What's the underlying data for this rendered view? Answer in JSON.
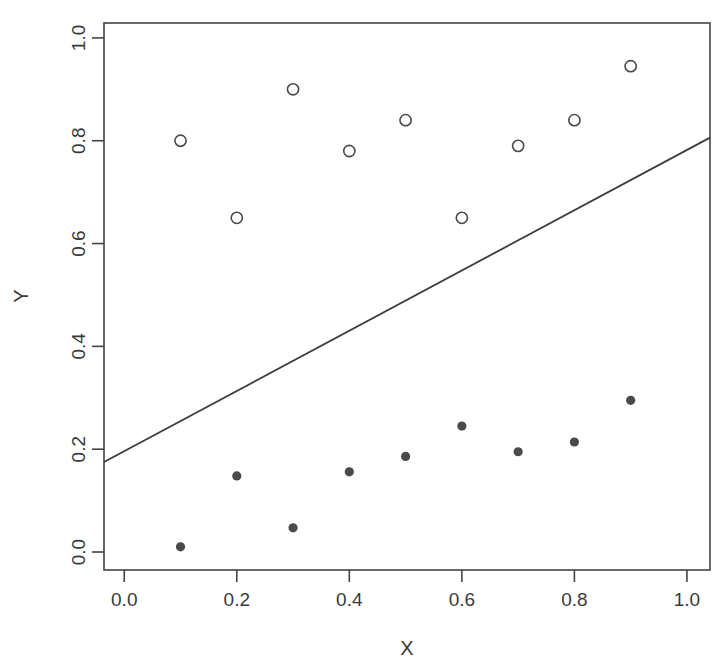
{
  "chart_data": {
    "type": "scatter",
    "title": "",
    "xlabel": "X",
    "ylabel": "Y",
    "xlim": [
      -0.036,
      1.041
    ],
    "ylim": [
      -0.035,
      1.029
    ],
    "xticks": [
      0.0,
      0.2,
      0.4,
      0.6,
      0.8,
      1.0
    ],
    "yticks": [
      0.0,
      0.2,
      0.4,
      0.6,
      0.8,
      1.0
    ],
    "xtick_labels": [
      "0.0",
      "0.2",
      "0.4",
      "0.6",
      "0.8",
      "1.0"
    ],
    "ytick_labels": [
      "0.0",
      "0.2",
      "0.4",
      "0.6",
      "0.8",
      "1.0"
    ],
    "grid": false,
    "legend": "none",
    "frame": "box",
    "series": [
      {
        "name": "upper-group-open-circles",
        "marker": "open-circle",
        "color": "#4a4a4a",
        "x": [
          0.1,
          0.2,
          0.3,
          0.4,
          0.5,
          0.6,
          0.7,
          0.8,
          0.9
        ],
        "y": [
          0.8,
          0.65,
          0.9,
          0.78,
          0.84,
          0.65,
          0.79,
          0.84,
          0.945
        ]
      },
      {
        "name": "lower-group-filled-circles",
        "marker": "filled-circle",
        "color": "#4a4a4a",
        "x": [
          0.1,
          0.2,
          0.3,
          0.4,
          0.5,
          0.6,
          0.7,
          0.8,
          0.9
        ],
        "y": [
          0.01,
          0.148,
          0.047,
          0.156,
          0.186,
          0.245,
          0.195,
          0.214,
          0.295
        ]
      }
    ],
    "lines": [
      {
        "name": "reference-line",
        "color": "#3c3c3c",
        "x": [
          -0.036,
          1.041
        ],
        "y": [
          0.175,
          0.806
        ],
        "slope": 0.586,
        "intercept": 0.196
      }
    ]
  },
  "axes": {
    "x_title": "X",
    "y_title": "Y"
  }
}
